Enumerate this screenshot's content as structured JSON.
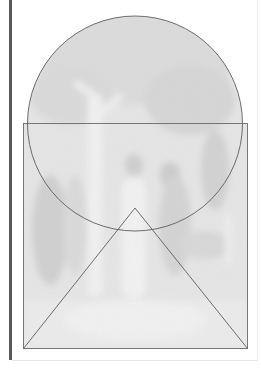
{
  "figure": {
    "overlay_shapes": [
      "circle",
      "rectangle",
      "triangle"
    ],
    "colors": {
      "painting_tone": "#e4e4e4",
      "painting_shadow": "#d2d2d2",
      "painting_highlight": "#f4f4f4",
      "line": "#5e5e5e",
      "spine": "#5a5a5a",
      "background": "#ffffff"
    },
    "geometry": {
      "circle": {
        "cx": 135,
        "cy": 123.5,
        "r": 107.5
      },
      "rectangle": {
        "x": 23.5,
        "y": 123.5,
        "width": 224,
        "height": 225
      },
      "triangle": {
        "apex": [
          135,
          208
        ],
        "left": [
          23.5,
          348.5
        ],
        "right": [
          247.5,
          348.5
        ]
      }
    }
  }
}
